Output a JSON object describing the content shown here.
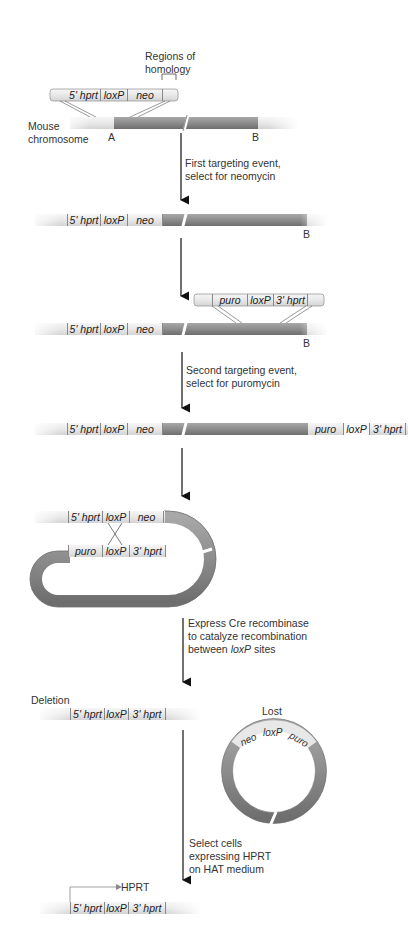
{
  "title_labels": {
    "regions_of_homology": [
      "Regions of",
      "homology"
    ],
    "mouse_chromosome": [
      "Mouse",
      "chromosome"
    ],
    "point_a": "A",
    "point_b": "B"
  },
  "steps": [
    {
      "lines": [
        "First targeting event,",
        "select for neomycin"
      ]
    },
    {
      "lines": [
        "Second targeting event,",
        "select for puromycin"
      ]
    },
    {
      "lines": [
        "Express Cre recombinase",
        "to catalyze recombination",
        "between loxP sites"
      ]
    },
    {
      "lines": [
        "Select cells",
        "expressing HPRT",
        "on HAT medium"
      ]
    }
  ],
  "constructs": {
    "vector1": [
      "5' hprt",
      "loxP",
      "neo"
    ],
    "vector2": [
      "puro",
      "loxP",
      "3' hprt"
    ],
    "after_first": [
      "5' hprt",
      "loxP",
      "neo"
    ],
    "after_second_left": [
      "5' hprt",
      "loxP",
      "neo"
    ],
    "after_second_right": [
      "puro",
      "loxP",
      "3' hprt"
    ],
    "loop_top": [
      "5' hprt",
      "loxP",
      "neo"
    ],
    "loop_bottom": [
      "puro",
      "loxP",
      "3' hprt"
    ],
    "deletion": [
      "5' hprt",
      "loxP",
      "3' hprt"
    ],
    "circle": [
      "neo",
      "loxP",
      "puro"
    ],
    "final": [
      "5' hprt",
      "loxP",
      "3' hprt"
    ]
  },
  "labels": {
    "deletion": "Deletion",
    "lost": "Lost",
    "hprt_product": "HPRT"
  },
  "colors": {
    "chromosome_dark": "#8a8a8a",
    "chromosome_light": "#e6e6e6",
    "segment_fill": "#ececec",
    "arrow": "#111111"
  }
}
